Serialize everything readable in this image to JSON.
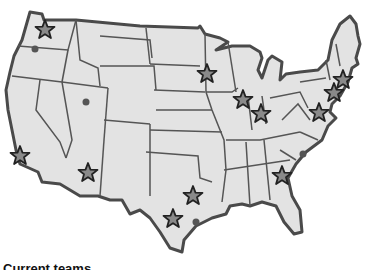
{
  "map": {
    "title": "US map with team locations",
    "land_color": "#e3e3e3",
    "border_color": "#4a4a4a",
    "star_fill": "#8a8a8a",
    "star_stroke": "#222222",
    "dot_color": "#555555",
    "markers": [
      {
        "type": "star",
        "name": "Seattle",
        "x": 45,
        "y": 30
      },
      {
        "type": "star",
        "name": "Minneapolis",
        "x": 207,
        "y": 74
      },
      {
        "type": "star",
        "name": "Chicago",
        "x": 243,
        "y": 100
      },
      {
        "type": "star",
        "name": "Indianapolis",
        "x": 261,
        "y": 114
      },
      {
        "type": "star",
        "name": "Boston",
        "x": 343,
        "y": 80
      },
      {
        "type": "star",
        "name": "New York",
        "x": 334,
        "y": 93
      },
      {
        "type": "star",
        "name": "Washington DC",
        "x": 319,
        "y": 113
      },
      {
        "type": "star",
        "name": "Los Angeles",
        "x": 20,
        "y": 156
      },
      {
        "type": "star",
        "name": "Phoenix",
        "x": 88,
        "y": 173
      },
      {
        "type": "star",
        "name": "Dallas",
        "x": 193,
        "y": 196
      },
      {
        "type": "star",
        "name": "Houston",
        "x": 173,
        "y": 219
      },
      {
        "type": "star",
        "name": "Atlanta",
        "x": 282,
        "y": 176
      },
      {
        "type": "dot",
        "name": "Portland",
        "x": 35,
        "y": 49
      },
      {
        "type": "dot",
        "name": "Salt Lake City",
        "x": 86,
        "y": 102
      },
      {
        "type": "dot",
        "name": "Charlotte",
        "x": 303,
        "y": 154
      },
      {
        "type": "dot",
        "name": "Houston area",
        "x": 196,
        "y": 222
      }
    ]
  },
  "caption": "Current teams"
}
